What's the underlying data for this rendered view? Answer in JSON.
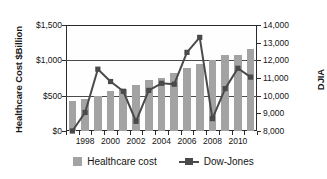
{
  "chart_data": {
    "type": "bar",
    "title": "",
    "xlabel": "",
    "ylabel": "Healthcare Cost $Billion",
    "y2label": "DJIA",
    "grid": true,
    "legend_position": "bottom",
    "categories": [
      1997,
      1998,
      1999,
      2000,
      2001,
      2002,
      2003,
      2004,
      2005,
      2006,
      2007,
      2008,
      2009,
      2010,
      2011
    ],
    "x_tick_labels": [
      "1998",
      "2000",
      "2002",
      "2004",
      "2006",
      "2008",
      "2010"
    ],
    "x_tick_years": [
      1998,
      2000,
      2002,
      2004,
      2006,
      2008,
      2010
    ],
    "ylim": [
      0,
      1500
    ],
    "y_ticks": [
      0,
      500,
      1000,
      1500
    ],
    "y_tick_labels": [
      "$0",
      "$500",
      "$1,000",
      "$1,500"
    ],
    "y2lim": [
      8000,
      14000
    ],
    "y2_ticks": [
      8000,
      9000,
      10000,
      11000,
      12000,
      13000,
      14000
    ],
    "y2_tick_labels": [
      "8,000",
      "9,000",
      "10,000",
      "11,000",
      "12,000",
      "13,000",
      "14,000"
    ],
    "series": [
      {
        "name": "Healthcare cost",
        "type": "bar",
        "axis": "left",
        "color": "#a3a3a3",
        "values": [
          430,
          460,
          500,
          560,
          600,
          655,
          720,
          750,
          825,
          885,
          950,
          1000,
          1075,
          1080,
          1160
        ]
      },
      {
        "name": "Dow-Jones",
        "type": "line",
        "axis": "right",
        "color": "#4a4a4a",
        "values": [
          8000,
          9050,
          11500,
          10800,
          10250,
          8550,
          10300,
          10700,
          10650,
          12450,
          13300,
          8700,
          10400,
          11550,
          11050
        ]
      }
    ],
    "legend": [
      {
        "label": "Healthcare cost",
        "marker": "square",
        "color": "#a3a3a3"
      },
      {
        "label": "Dow-Jones",
        "marker": "line-square",
        "color": "#4a4a4a"
      }
    ]
  }
}
